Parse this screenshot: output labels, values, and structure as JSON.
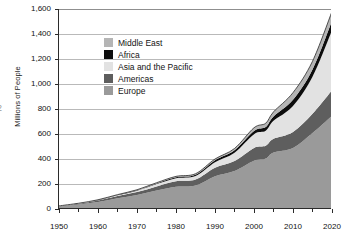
{
  "page_artifact": "2",
  "chart_data": {
    "type": "area",
    "stacked": true,
    "title": "",
    "xlabel": "",
    "ylabel": "Millions of People",
    "xlim": [
      1950,
      2020
    ],
    "ylim": [
      0,
      1600
    ],
    "ytick_values": [
      0,
      200,
      400,
      600,
      800,
      1000,
      1200,
      1400,
      1600
    ],
    "ytick_labels": [
      "0",
      "200",
      "400",
      "600",
      "800",
      "1,000",
      "1,200",
      "1,400",
      "1,600"
    ],
    "xtick_values": [
      1950,
      1960,
      1970,
      1980,
      1990,
      2000,
      2010,
      2020
    ],
    "xtick_labels": [
      "1950",
      "1960",
      "1970",
      "1980",
      "1990",
      "2000",
      "2010",
      "2020"
    ],
    "xtick_minor_values": [
      1955,
      1965,
      1975,
      1985,
      1995,
      2005,
      2015
    ],
    "grid": "horizontal",
    "legend_position": "upper-left-inside",
    "x": [
      1950,
      1955,
      1960,
      1965,
      1970,
      1975,
      1980,
      1985,
      1990,
      1995,
      2000,
      2003,
      2005,
      2010,
      2015,
      2020
    ],
    "series": [
      {
        "name": "Europe",
        "color": "#9a9a9a",
        "values": [
          20,
          36,
          56,
          86,
          113,
          148,
          178,
          188,
          262,
          304,
          386,
          404,
          452,
          489,
          608,
          745
        ]
      },
      {
        "name": "Americas",
        "color": "#5e5e5e",
        "values": [
          3,
          6,
          12,
          18,
          23,
          33,
          45,
          48,
          68,
          80,
          103,
          102,
          110,
          128,
          154,
          205
        ]
      },
      {
        "name": "Asia and the Pacific",
        "color": "#e2e2e2",
        "values": [
          1,
          2,
          3,
          6,
          11,
          19,
          24,
          29,
          45,
          67,
          110,
          120,
          144,
          208,
          296,
          480
        ]
      },
      {
        "name": "Africa",
        "color": "#0d0d0d",
        "values": [
          1,
          1,
          2,
          3,
          4,
          5,
          7,
          9,
          15,
          19,
          26,
          30,
          35,
          50,
          58,
          75
        ]
      },
      {
        "name": "Middle East",
        "color": "#b5b5b5",
        "values": [
          0,
          1,
          1,
          2,
          3,
          5,
          7,
          8,
          10,
          14,
          25,
          30,
          36,
          56,
          66,
          75
        ]
      }
    ],
    "totals": [
      25,
      46,
      74,
      115,
      154,
      210,
      261,
      282,
      400,
      484,
      650,
      686,
      777,
      931,
      1182,
      1580
    ]
  },
  "legend": {
    "items": [
      {
        "label": "Middle East",
        "color": "#b5b5b5"
      },
      {
        "label": "Africa",
        "color": "#0d0d0d"
      },
      {
        "label": "Asia and the Pacific",
        "color": "#e2e2e2"
      },
      {
        "label": "Americas",
        "color": "#5e5e5e"
      },
      {
        "label": "Europe",
        "color": "#9a9a9a"
      }
    ]
  },
  "colors": {
    "axis": "#2b2b2b",
    "grid": "#b9b9b9",
    "text": "#111111",
    "background": "#ffffff"
  }
}
